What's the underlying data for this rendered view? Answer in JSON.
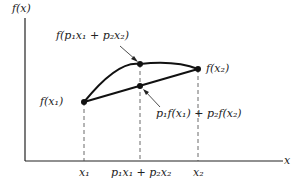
{
  "diagram": {
    "y_axis_label": "f(x)",
    "x_axis_label": "x",
    "labels": {
      "upper_point": "f(p₁x₁ + p₂x₂)",
      "right_point": "f(x₂)",
      "left_point": "f(x₁)",
      "chord_point": "p₁f(x₁) + p₂f(x₂)"
    },
    "x_ticks": [
      "x₁",
      "p₁x₁ + p₂x₂",
      "x₂"
    ]
  }
}
